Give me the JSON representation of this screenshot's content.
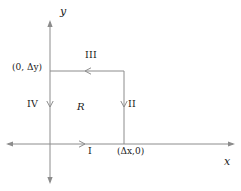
{
  "figure": {
    "background_color": "#ffffff",
    "line_color": "#808080",
    "text_color": "#1a1a1a"
  },
  "axes": {
    "x_label": "x",
    "y_label": "y",
    "origin_px": {
      "x": 50,
      "y": 144
    },
    "x_axis": {
      "from_px": 8,
      "to_px": 233,
      "y_px": 144,
      "arrows": "both"
    },
    "y_axis": {
      "x_px": 50,
      "from_px": 182,
      "to_px": 22,
      "arrows": "both"
    }
  },
  "region": {
    "name_label": "R",
    "name_label_px": {
      "x": 78,
      "y": 108
    },
    "rect_px": {
      "left": 50,
      "top": 71,
      "right": 124,
      "bottom": 144
    }
  },
  "vertices": [
    {
      "id": "vertex-top-left",
      "label": "(0, Δy)",
      "px": {
        "x": 12,
        "y": 68
      }
    },
    {
      "id": "vertex-bottom-right",
      "label": "(Δx,0)",
      "px": {
        "x": 118,
        "y": 150
      }
    }
  ],
  "edges": [
    {
      "id": "edge-I",
      "label": "I",
      "side": "bottom",
      "direction": "right",
      "label_px": {
        "x": 90,
        "y": 148
      },
      "arrow_px": {
        "x": 82,
        "y": 144
      }
    },
    {
      "id": "edge-II",
      "label": "II",
      "side": "right",
      "direction": "down",
      "label_px": {
        "x": 128,
        "y": 103
      },
      "arrow_px": {
        "x": 124,
        "y": 105
      }
    },
    {
      "id": "edge-III",
      "label": "III",
      "side": "top",
      "direction": "left",
      "label_px": {
        "x": 87,
        "y": 54
      },
      "arrow_px": {
        "x": 88,
        "y": 71
      }
    },
    {
      "id": "edge-IV",
      "label": "IV",
      "side": "left",
      "direction": "down",
      "label_px": {
        "x": 28,
        "y": 103
      },
      "arrow_px": {
        "x": 50,
        "y": 105
      }
    }
  ]
}
